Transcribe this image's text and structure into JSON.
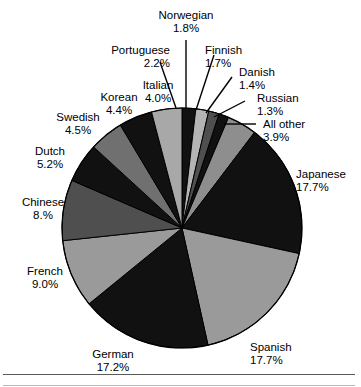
{
  "chart_data": {
    "type": "pie",
    "title": "",
    "subtitle": "",
    "xlabel": "",
    "ylabel": "",
    "legend_position": "none",
    "grid": false,
    "label_format": "name above percent",
    "start_angle_deg": 0,
    "direction": "clockwise",
    "center": {
      "x": 182,
      "y": 228
    },
    "radius": 120,
    "categories": [
      "Norwegian",
      "Finnish",
      "Danish",
      "Russian",
      "All other",
      "Japanese",
      "Spanish",
      "German",
      "French",
      "Chinese",
      "Dutch",
      "Swedish",
      "Korean",
      "Italian"
    ],
    "values": [
      1.8,
      1.7,
      1.4,
      1.3,
      3.9,
      17.7,
      17.7,
      17.2,
      9.0,
      8.0,
      5.2,
      4.5,
      4.4,
      4.0
    ],
    "value_labels": [
      "1.8%",
      "1.7%",
      "1.4%",
      "1.3%",
      "3.9%",
      "17.7%",
      "17.7%",
      "17.2%",
      "9.0%",
      "8.%",
      "5.2%",
      "4.5%",
      "4.4%",
      "4.0%"
    ],
    "slice_colors": [
      "#111111",
      "#b4b4b4",
      "#4f4f4f",
      "#111111",
      "#8e8e8e",
      "#111111",
      "#9a9a9a",
      "#111111",
      "#9a9a9a",
      "#4f4f4f",
      "#111111",
      "#707070",
      "#111111",
      "#a8a8a8"
    ],
    "slices": [
      {
        "name": "Norwegian",
        "value": 1.8,
        "label": "1.8%",
        "color": "#111111"
      },
      {
        "name": "Finnish",
        "value": 1.7,
        "label": "1.7%",
        "color": "#b4b4b4"
      },
      {
        "name": "Danish",
        "value": 1.4,
        "label": "1.4%",
        "color": "#4f4f4f"
      },
      {
        "name": "Russian",
        "value": 1.3,
        "label": "1.3%",
        "color": "#111111"
      },
      {
        "name": "All other",
        "value": 3.9,
        "label": "3.9%",
        "color": "#8e8e8e"
      },
      {
        "name": "Japanese",
        "value": 17.7,
        "label": "17.7%",
        "color": "#111111"
      },
      {
        "name": "Spanish",
        "value": 17.7,
        "label": "17.7%",
        "color": "#9a9a9a"
      },
      {
        "name": "German",
        "value": 17.2,
        "label": "17.2%",
        "color": "#111111"
      },
      {
        "name": "French",
        "value": 9.0,
        "label": "9.0%",
        "color": "#9a9a9a"
      },
      {
        "name": "Chinese",
        "value": 8.0,
        "label": "8.%",
        "color": "#4f4f4f"
      },
      {
        "name": "Dutch",
        "value": 5.2,
        "label": "5.2%",
        "color": "#111111"
      },
      {
        "name": "Swedish",
        "value": 4.5,
        "label": "4.5%",
        "color": "#707070"
      },
      {
        "name": "Korean",
        "value": 4.4,
        "label": "4.4%",
        "color": "#111111"
      },
      {
        "name": "Italian",
        "value": 4.0,
        "label": "4.0%",
        "color": "#a8a8a8"
      }
    ],
    "colors": {
      "outline": "#000000",
      "background": "#ffffff",
      "text": "#000000",
      "leader_line": "#000000",
      "rule": "#5a5a5a"
    }
  },
  "labels": {
    "norwegian": {
      "name": "Norwegian",
      "percent": "1.8%"
    },
    "portuguese": {
      "name": "Portuguese",
      "percent": "2.2%"
    },
    "finnish": {
      "name": "Finnish",
      "percent": "1.7%"
    },
    "danish": {
      "name": "Danish",
      "percent": "1.4%"
    },
    "russian": {
      "name": "Russian",
      "percent": "1.3%"
    },
    "all_other": {
      "name": "All other",
      "percent": "3.9%"
    },
    "japanese": {
      "name": "Japanese",
      "percent": "17.7%"
    },
    "spanish": {
      "name": "Spanish",
      "percent": "17.7%"
    },
    "german": {
      "name": "German",
      "percent": "17.2%"
    },
    "french": {
      "name": "French",
      "percent": "9.0%"
    },
    "chinese": {
      "name": "Chinese",
      "percent": "8.%"
    },
    "dutch": {
      "name": "Dutch",
      "percent": "5.2%"
    },
    "swedish": {
      "name": "Swedish",
      "percent": "4.5%"
    },
    "korean": {
      "name": "Korean",
      "percent": "4.4%"
    },
    "italian": {
      "name": "Italian",
      "percent": "4.0%"
    }
  }
}
